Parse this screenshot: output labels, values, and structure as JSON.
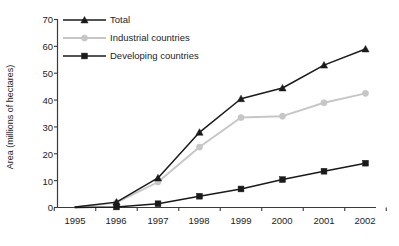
{
  "chart_data": {
    "type": "line",
    "title": "",
    "xlabel": "",
    "ylabel": "Area (millions of hectares)",
    "categories": [
      "1995",
      "1996",
      "1997",
      "1998",
      "1999",
      "2000",
      "2001",
      "2002"
    ],
    "x": [
      1995,
      1996,
      1997,
      1998,
      1999,
      2000,
      2001,
      2002
    ],
    "xlim": [
      1994.5,
      2002.5
    ],
    "ylim": [
      0,
      70
    ],
    "yticks": [
      0,
      10,
      20,
      30,
      40,
      50,
      60,
      70
    ],
    "ytick_labels": [
      "0",
      "10",
      "20",
      "30",
      "40",
      "50",
      "60",
      "70"
    ],
    "grid": false,
    "legend_position": "top-left-inside",
    "series": [
      {
        "name": "Total",
        "marker": "triangle",
        "color": "#1a1a1a",
        "values": [
          0.2,
          2.0,
          11.0,
          28.0,
          40.5,
          44.5,
          53.0,
          59.0
        ]
      },
      {
        "name": "Industrial countries",
        "marker": "circle",
        "color": "#c6c6c6",
        "values": [
          0.0,
          1.8,
          9.5,
          22.5,
          33.5,
          34.0,
          39.0,
          42.5
        ]
      },
      {
        "name": "Developing countries",
        "marker": "square",
        "color": "#1a1a1a",
        "values": [
          0.0,
          0.2,
          1.4,
          4.2,
          6.9,
          10.4,
          13.5,
          16.5
        ]
      }
    ]
  },
  "legend": {
    "items": [
      {
        "label": "Total"
      },
      {
        "label": "Industrial countries"
      },
      {
        "label": "Developing countries"
      }
    ]
  },
  "axes": {
    "y_title": "Area (millions of hectares)",
    "y_tick_labels": [
      "70",
      "60",
      "50",
      "40",
      "30",
      "20",
      "10",
      "0"
    ],
    "x_tick_labels": [
      "1995",
      "1996",
      "1997",
      "1998",
      "1999",
      "2000",
      "2001",
      "2002"
    ]
  },
  "colors": {
    "total": "#1a1a1a",
    "industrial": "#c6c6c6",
    "developing": "#1a1a1a",
    "axis": "#3a3a3a",
    "background": "#ffffff"
  },
  "footer": {
    "cut_text": ""
  }
}
